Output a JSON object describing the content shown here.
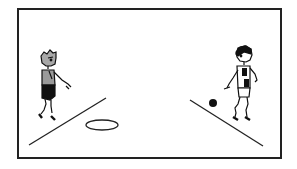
{
  "scene": {
    "description": "Pixel-art illustration of two children playing a ball game",
    "colors": {
      "frame": "#222222",
      "ink": "#111111",
      "shirt_gray": "#9a9a9a",
      "background": "#ffffff"
    },
    "elements": {
      "left_child": "child-standing-left",
      "right_child": "child-standing-right",
      "ball": "ball",
      "target_ring": "target-ring",
      "left_line": "left-boundary-line",
      "right_line": "right-boundary-line"
    }
  }
}
